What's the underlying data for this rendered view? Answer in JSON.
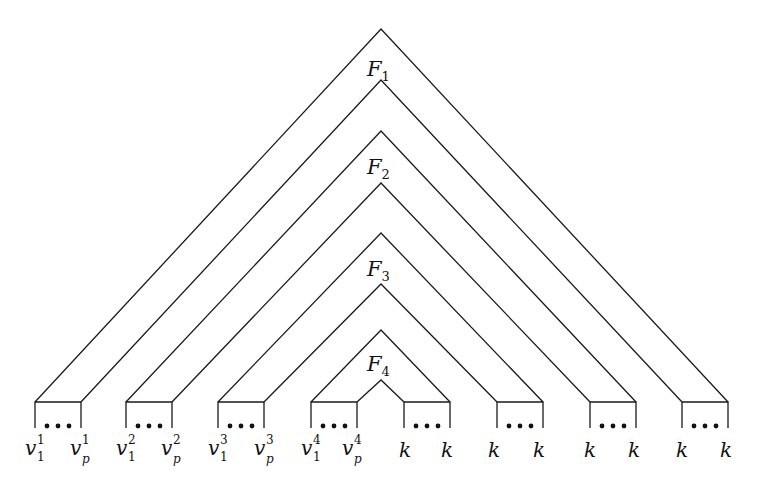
{
  "diagram": {
    "type": "nested-triangle-formula-structure",
    "layers": [
      {
        "label_main": "F",
        "label_sub": "1"
      },
      {
        "label_main": "F",
        "label_sub": "2"
      },
      {
        "label_main": "F",
        "label_sub": "3"
      },
      {
        "label_main": "F",
        "label_sub": "4"
      }
    ],
    "dots": "•••",
    "leaves": [
      {
        "left_main": "v",
        "left_sub": "1",
        "left_sup": "1",
        "right_main": "v",
        "right_sub": "p",
        "right_sup": "1"
      },
      {
        "left_main": "v",
        "left_sub": "1",
        "left_sup": "2",
        "right_main": "v",
        "right_sub": "p",
        "right_sup": "2"
      },
      {
        "left_main": "v",
        "left_sub": "1",
        "left_sup": "3",
        "right_main": "v",
        "right_sub": "p",
        "right_sup": "3"
      },
      {
        "left_main": "v",
        "left_sub": "1",
        "left_sup": "4",
        "right_main": "v",
        "right_sub": "p",
        "right_sup": "4"
      },
      {
        "left_main": "k",
        "right_main": "k"
      },
      {
        "left_main": "k",
        "right_main": "k"
      },
      {
        "left_main": "k",
        "right_main": "k"
      },
      {
        "left_main": "k",
        "right_main": "k"
      }
    ]
  }
}
